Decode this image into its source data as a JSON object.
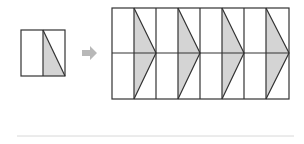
{
  "diagram": {
    "colors": {
      "stroke": "#333333",
      "shade": "#d4d4d4",
      "arrow": "#b8b8b8",
      "divider": "#d8d8d8",
      "background": "#ffffff"
    },
    "source_tile": {
      "x": 21,
      "y": 30,
      "width": 44,
      "height": 46,
      "columns": 2
    },
    "arrow": {
      "direction": "right",
      "icon": "right-arrow-icon"
    },
    "result_grid": {
      "x": 112,
      "y": 8,
      "width": 177,
      "height": 91,
      "columns": 8,
      "rows": 2,
      "shaded_shapes": 4
    }
  }
}
